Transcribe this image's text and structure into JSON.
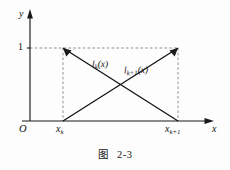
{
  "figure": {
    "caption_prefix": "图",
    "caption_number": "2-3",
    "axes": {
      "x_axis_label": "x",
      "y_axis_label": "y",
      "origin_label": "O"
    },
    "ticks": {
      "y_one": "1",
      "x_left_base": "x",
      "x_left_sub": "k",
      "x_right_base": "x",
      "x_right_sub": "k+1"
    },
    "curves": [
      {
        "name": "l-k",
        "label_base": "l",
        "label_sub": "k",
        "label_arg": "(x)",
        "description": "decreasing linear hat function from (x_k, 1) to (x_k+1, 0)"
      },
      {
        "name": "l-k-plus-1",
        "label_base": "l",
        "label_sub": "k+1",
        "label_arg": "(x)",
        "description": "increasing linear hat function from (x_k, 0) to (x_k+1, 1)"
      }
    ],
    "colors": {
      "ink": "#111111",
      "dashed": "#7d7d7d",
      "background": "#fdfdfd"
    }
  }
}
